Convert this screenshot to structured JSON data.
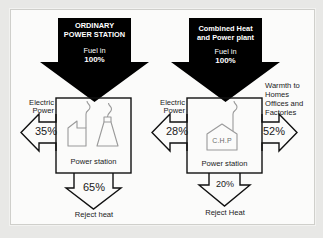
{
  "diagram": {
    "background_color": "#e8e8e6",
    "panel_color": "#fbfbfa",
    "ink_color": "#111111",
    "arrow_fill_color": "#000000"
  },
  "left_system": {
    "fuel_arrow": {
      "name_line1": "ORDINARY",
      "name_line2": "POWER STATION",
      "fuel_label": "Fuel in",
      "fuel_value": "100%"
    },
    "plant_box": {
      "caption": "Power station",
      "icons": [
        "factory-with-chimney-icon",
        "cooling-tower-icon"
      ]
    },
    "outputs": [
      {
        "key": "electric",
        "label_line1": "Electric",
        "label_line2": "Power",
        "value": "35%",
        "direction": "left"
      },
      {
        "key": "reject",
        "label": "Reject heat",
        "value": "65%",
        "direction": "down"
      }
    ]
  },
  "right_system": {
    "fuel_arrow": {
      "name_line1": "Combined Heat",
      "name_line2": "and Power plant",
      "fuel_label": "Fuel in",
      "fuel_value": "100%"
    },
    "plant_box": {
      "caption": "Power station",
      "icons": [
        "chp-building-icon"
      ],
      "icon_label": "C.H.P"
    },
    "outputs": [
      {
        "key": "electric",
        "label_line1": "Electric",
        "label_line2": "Power",
        "value": "28%",
        "direction": "left"
      },
      {
        "key": "warmth",
        "label_line1": "Warmth to",
        "label_line2": "Homes",
        "label_line3": "Offices and",
        "label_line4": "Factories",
        "value": "52%",
        "direction": "right"
      },
      {
        "key": "reject",
        "label": "Reject Heat",
        "value": "20%",
        "direction": "down"
      }
    ]
  }
}
